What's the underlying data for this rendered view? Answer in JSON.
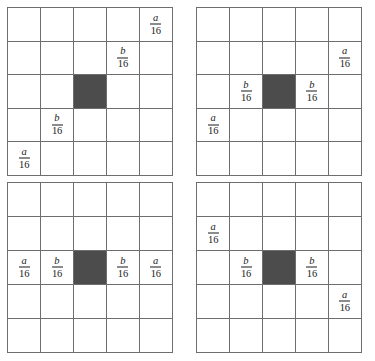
{
  "figure": {
    "title": "",
    "grid_size": 5,
    "colors": {
      "line": "#6e6e6e",
      "shaded_cell": "#4c4c4c",
      "text": "#1b1b1b",
      "background": "#ffffff"
    },
    "labels": {
      "a_numerator": "a",
      "b_numerator": "b",
      "denominator": "16",
      "a_fraction": "a/16",
      "b_fraction": "b/16"
    },
    "grids": [
      {
        "id": "top-left",
        "name": "grid-top-left",
        "rows": [
          [
            {
              "t": "empty"
            },
            {
              "t": "empty"
            },
            {
              "t": "empty"
            },
            {
              "t": "empty"
            },
            {
              "t": "frac",
              "num": "a",
              "den": "16"
            }
          ],
          [
            {
              "t": "empty"
            },
            {
              "t": "empty"
            },
            {
              "t": "empty"
            },
            {
              "t": "frac",
              "num": "b",
              "den": "16"
            },
            {
              "t": "empty"
            }
          ],
          [
            {
              "t": "empty"
            },
            {
              "t": "empty"
            },
            {
              "t": "shaded"
            },
            {
              "t": "empty"
            },
            {
              "t": "empty"
            }
          ],
          [
            {
              "t": "empty"
            },
            {
              "t": "frac",
              "num": "b",
              "den": "16"
            },
            {
              "t": "empty"
            },
            {
              "t": "empty"
            },
            {
              "t": "empty"
            }
          ],
          [
            {
              "t": "frac",
              "num": "a",
              "den": "16"
            },
            {
              "t": "empty"
            },
            {
              "t": "empty"
            },
            {
              "t": "empty"
            },
            {
              "t": "empty"
            }
          ]
        ]
      },
      {
        "id": "top-right",
        "name": "grid-top-right",
        "rows": [
          [
            {
              "t": "empty"
            },
            {
              "t": "empty"
            },
            {
              "t": "empty"
            },
            {
              "t": "empty"
            },
            {
              "t": "empty"
            }
          ],
          [
            {
              "t": "empty"
            },
            {
              "t": "empty"
            },
            {
              "t": "empty"
            },
            {
              "t": "empty"
            },
            {
              "t": "frac",
              "num": "a",
              "den": "16"
            }
          ],
          [
            {
              "t": "empty"
            },
            {
              "t": "frac",
              "num": "b",
              "den": "16"
            },
            {
              "t": "shaded"
            },
            {
              "t": "frac",
              "num": "b",
              "den": "16"
            },
            {
              "t": "empty"
            }
          ],
          [
            {
              "t": "frac",
              "num": "a",
              "den": "16"
            },
            {
              "t": "empty"
            },
            {
              "t": "empty"
            },
            {
              "t": "empty"
            },
            {
              "t": "empty"
            }
          ],
          [
            {
              "t": "empty"
            },
            {
              "t": "empty"
            },
            {
              "t": "empty"
            },
            {
              "t": "empty"
            },
            {
              "t": "empty"
            }
          ]
        ]
      },
      {
        "id": "bottom-left",
        "name": "grid-bottom-left",
        "rows": [
          [
            {
              "t": "empty"
            },
            {
              "t": "empty"
            },
            {
              "t": "empty"
            },
            {
              "t": "empty"
            },
            {
              "t": "empty"
            }
          ],
          [
            {
              "t": "empty"
            },
            {
              "t": "empty"
            },
            {
              "t": "empty"
            },
            {
              "t": "empty"
            },
            {
              "t": "empty"
            }
          ],
          [
            {
              "t": "frac",
              "num": "a",
              "den": "16"
            },
            {
              "t": "frac",
              "num": "b",
              "den": "16"
            },
            {
              "t": "shaded"
            },
            {
              "t": "frac",
              "num": "b",
              "den": "16"
            },
            {
              "t": "frac",
              "num": "a",
              "den": "16"
            }
          ],
          [
            {
              "t": "empty"
            },
            {
              "t": "empty"
            },
            {
              "t": "empty"
            },
            {
              "t": "empty"
            },
            {
              "t": "empty"
            }
          ],
          [
            {
              "t": "empty"
            },
            {
              "t": "empty"
            },
            {
              "t": "empty"
            },
            {
              "t": "empty"
            },
            {
              "t": "empty"
            }
          ]
        ]
      },
      {
        "id": "bottom-right",
        "name": "grid-bottom-right",
        "rows": [
          [
            {
              "t": "empty"
            },
            {
              "t": "empty"
            },
            {
              "t": "empty"
            },
            {
              "t": "empty"
            },
            {
              "t": "empty"
            }
          ],
          [
            {
              "t": "frac",
              "num": "a",
              "den": "16"
            },
            {
              "t": "empty"
            },
            {
              "t": "empty"
            },
            {
              "t": "empty"
            },
            {
              "t": "empty"
            }
          ],
          [
            {
              "t": "empty"
            },
            {
              "t": "frac",
              "num": "b",
              "den": "16"
            },
            {
              "t": "shaded"
            },
            {
              "t": "frac",
              "num": "b",
              "den": "16"
            },
            {
              "t": "empty"
            }
          ],
          [
            {
              "t": "empty"
            },
            {
              "t": "empty"
            },
            {
              "t": "empty"
            },
            {
              "t": "empty"
            },
            {
              "t": "frac",
              "num": "a",
              "den": "16"
            }
          ],
          [
            {
              "t": "empty"
            },
            {
              "t": "empty"
            },
            {
              "t": "empty"
            },
            {
              "t": "empty"
            },
            {
              "t": "empty"
            }
          ]
        ]
      }
    ]
  }
}
